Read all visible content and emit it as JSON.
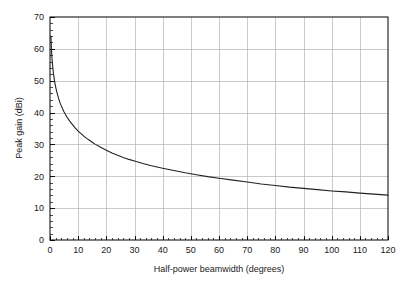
{
  "chart_data": {
    "type": "line",
    "title": "",
    "xlabel": "Half-power beamwidth (degrees)",
    "ylabel": "Peak gain (dBi)",
    "xlim": [
      0,
      120
    ],
    "ylim": [
      0,
      70
    ],
    "xticks": [
      0,
      10,
      20,
      30,
      40,
      50,
      60,
      70,
      80,
      90,
      100,
      110,
      120
    ],
    "yticks": [
      0,
      10,
      20,
      30,
      40,
      50,
      60,
      70
    ],
    "xtick_labels": [
      "0",
      "10",
      "20",
      "30",
      "40",
      "50",
      "60",
      "70",
      "80",
      "90",
      "100",
      "110",
      "120"
    ],
    "ytick_labels": [
      "0",
      "10",
      "20",
      "30",
      "40",
      "50",
      "60",
      "70"
    ],
    "x_minor_step": 2,
    "y_minor_step": 2,
    "grid": true,
    "grid_color": "#b4b4b4",
    "legend": null,
    "line_color": "#222222",
    "line_width": 1.1,
    "axis_color": "#000000",
    "series": [
      {
        "name": "Peak gain",
        "x": [
          0.32,
          0.4,
          0.5,
          0.6,
          0.7,
          0.8,
          0.9,
          1.0,
          1.2,
          1.5,
          1.8,
          2.1,
          2.5,
          3.0,
          3.5,
          4.0,
          4.5,
          5.0,
          6.0,
          7.0,
          8.0,
          9.0,
          10.0,
          11.0,
          12.0,
          13.0,
          14.0,
          15.0,
          16.0,
          18.0,
          20.0,
          22.0,
          24.0,
          26.0,
          28.0,
          30.0,
          33.0,
          36.0,
          40.0,
          44.0,
          48.0,
          52.0,
          56.0,
          60.0,
          65.0,
          70.0,
          75.0,
          80.0,
          85.0,
          90.0,
          95.0,
          100.0,
          105.0,
          110.0,
          115.0,
          120.0
        ],
        "y": [
          64.0,
          62.1,
          60.1,
          58.5,
          57.2,
          56.0,
          55.0,
          54.1,
          52.5,
          50.6,
          49.0,
          47.7,
          46.2,
          44.6,
          43.2,
          42.1,
          41.1,
          40.2,
          38.6,
          37.3,
          36.2,
          35.1,
          34.2,
          33.4,
          32.6,
          31.9,
          31.3,
          30.7,
          30.1,
          29.1,
          28.2,
          27.3,
          26.6,
          25.9,
          25.3,
          24.8,
          24.0,
          23.3,
          22.5,
          21.8,
          21.1,
          20.5,
          19.9,
          19.4,
          18.8,
          18.2,
          17.6,
          17.1,
          16.6,
          16.2,
          15.8,
          15.4,
          15.1,
          14.7,
          14.4,
          14.1
        ],
        "note_scale": "plotted as 10*log10(30000/theta^2)-style decay"
      }
    ],
    "plotted_values": {
      "comment": "Values read off the chart at labelled x positions",
      "at_x": [
        0.32,
        1,
        5,
        10,
        20,
        30,
        40,
        50,
        60,
        70,
        80,
        90,
        100,
        110,
        120
      ],
      "gain_dBi": [
        64.0,
        54.0,
        30.5,
        24.0,
        19.0,
        15.5,
        13.5,
        11.5,
        9.5,
        8.2,
        7.0,
        6.2,
        5.4,
        4.5,
        3.5
      ]
    }
  },
  "figure": {
    "background": "#ffffff",
    "plot_area": {
      "left": 50,
      "top": 17,
      "right": 388,
      "bottom": 240
    }
  }
}
